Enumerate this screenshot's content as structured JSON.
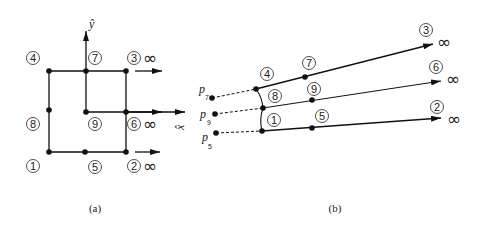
{
  "panel_a": {
    "caption": "(a)",
    "axis_x_label": "x̂",
    "axis_y_label": "ŷ",
    "nodes": [
      {
        "id": "1",
        "label": "1"
      },
      {
        "id": "2",
        "label": "2",
        "infinity": "∞"
      },
      {
        "id": "3",
        "label": "3",
        "infinity": "∞"
      },
      {
        "id": "4",
        "label": "4"
      },
      {
        "id": "5",
        "label": "5"
      },
      {
        "id": "6",
        "label": "6",
        "infinity": "∞"
      },
      {
        "id": "7",
        "label": "7"
      },
      {
        "id": "8",
        "label": "8"
      },
      {
        "id": "9",
        "label": "9"
      }
    ]
  },
  "panel_b": {
    "caption": "(b)",
    "points": [
      {
        "name": "p",
        "sub": "7"
      },
      {
        "name": "p",
        "sub": "9"
      },
      {
        "name": "p",
        "sub": "5"
      }
    ],
    "nodes": [
      {
        "id": "1",
        "label": "1"
      },
      {
        "id": "2",
        "label": "2",
        "infinity": "∞"
      },
      {
        "id": "3",
        "label": "3",
        "infinity": "∞"
      },
      {
        "id": "4",
        "label": "4"
      },
      {
        "id": "5",
        "label": "5"
      },
      {
        "id": "6",
        "label": "6",
        "infinity": "∞"
      },
      {
        "id": "7",
        "label": "7"
      },
      {
        "id": "8",
        "label": "8"
      },
      {
        "id": "9",
        "label": "9"
      }
    ]
  }
}
